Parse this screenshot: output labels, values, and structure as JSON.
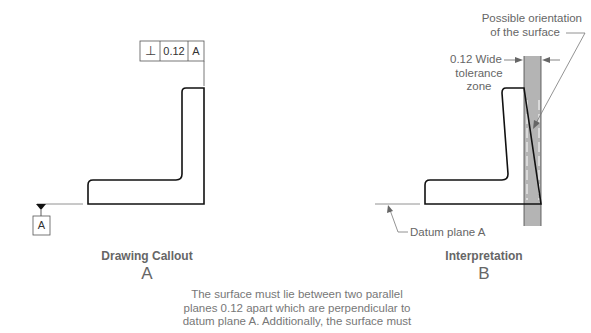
{
  "fcf": {
    "symbol": "⊥",
    "tolerance": "0.12",
    "datum": "A"
  },
  "datum_feature": {
    "label": "A"
  },
  "panel_a": {
    "caption": "Drawing Callout",
    "letter": "A"
  },
  "panel_b": {
    "caption": "Interpretation",
    "letter": "B",
    "note_orientation_line1": "Possible orientation",
    "note_orientation_line2": "of the surface",
    "note_zone_line1": "0.12 Wide",
    "note_zone_line2": "tolerance",
    "note_zone_line3": "zone",
    "note_datum": "Datum plane A"
  },
  "description": {
    "line1": "The surface must lie between two parallel",
    "line2": "planes 0.12 apart which are perpendicular to",
    "line3": "datum plane A. Additionally, the surface must"
  },
  "colors": {
    "zone_fill": "#b4b4b4",
    "line": "#111111",
    "text": "#666666"
  }
}
